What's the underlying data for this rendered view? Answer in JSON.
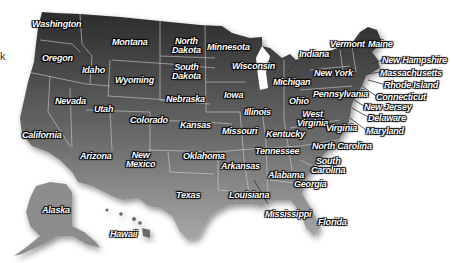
{
  "map": {
    "title": "United States map",
    "colors": {
      "top": "#2f2f2f",
      "bottom": "#9a9a9a",
      "border": "#d0d0d0",
      "label_text": "#ffffff",
      "label_outline": "#000000"
    },
    "edge_fragment": "k",
    "states": [
      {
        "name": "Washington",
        "x": 32,
        "y": 20
      },
      {
        "name": "Oregon",
        "x": 42,
        "y": 54
      },
      {
        "name": "Idaho",
        "x": 82,
        "y": 66
      },
      {
        "name": "Montana",
        "x": 112,
        "y": 38
      },
      {
        "name": "Wyoming",
        "x": 115,
        "y": 76
      },
      {
        "name": "North Dakota",
        "x": 172,
        "y": 37
      },
      {
        "name": "South Dakota",
        "x": 172,
        "y": 63
      },
      {
        "name": "Nebraska",
        "x": 166,
        "y": 95
      },
      {
        "name": "Minnesota",
        "x": 207,
        "y": 43
      },
      {
        "name": "Iowa",
        "x": 224,
        "y": 91
      },
      {
        "name": "Wisconsin",
        "x": 232,
        "y": 62
      },
      {
        "name": "Michigan",
        "x": 273,
        "y": 78
      },
      {
        "name": "Illinois",
        "x": 244,
        "y": 108
      },
      {
        "name": "Indiana",
        "x": 299,
        "y": 50
      },
      {
        "name": "Ohio",
        "x": 289,
        "y": 97
      },
      {
        "name": "Nevada",
        "x": 55,
        "y": 97
      },
      {
        "name": "Utah",
        "x": 94,
        "y": 105
      },
      {
        "name": "Colorado",
        "x": 130,
        "y": 116
      },
      {
        "name": "Kansas",
        "x": 180,
        "y": 121
      },
      {
        "name": "Missouri",
        "x": 222,
        "y": 127
      },
      {
        "name": "Kentucky",
        "x": 266,
        "y": 130
      },
      {
        "name": "West Virginia",
        "x": 297,
        "y": 110
      },
      {
        "name": "Virginia",
        "x": 326,
        "y": 124
      },
      {
        "name": "Maryland",
        "x": 366,
        "y": 127
      },
      {
        "name": "Delaware",
        "x": 368,
        "y": 114
      },
      {
        "name": "New Jersey",
        "x": 364,
        "y": 103
      },
      {
        "name": "Pennsylvania",
        "x": 313,
        "y": 90
      },
      {
        "name": "New York",
        "x": 314,
        "y": 69
      },
      {
        "name": "Vermont",
        "x": 330,
        "y": 40
      },
      {
        "name": "Maine",
        "x": 368,
        "y": 40
      },
      {
        "name": "New Hampshire",
        "x": 382,
        "y": 56
      },
      {
        "name": "Massachusetts",
        "x": 380,
        "y": 69
      },
      {
        "name": "Rhode Island",
        "x": 384,
        "y": 81
      },
      {
        "name": "Connecticut",
        "x": 376,
        "y": 93
      },
      {
        "name": "California",
        "x": 22,
        "y": 131
      },
      {
        "name": "Arizona",
        "x": 80,
        "y": 152
      },
      {
        "name": "New Mexico",
        "x": 126,
        "y": 151
      },
      {
        "name": "Oklahoma",
        "x": 183,
        "y": 152
      },
      {
        "name": "Tennessee",
        "x": 255,
        "y": 147
      },
      {
        "name": "North Carolina",
        "x": 312,
        "y": 142
      },
      {
        "name": "South Carolina",
        "x": 311,
        "y": 157
      },
      {
        "name": "Arkansas",
        "x": 221,
        "y": 162
      },
      {
        "name": "Alabama",
        "x": 268,
        "y": 171
      },
      {
        "name": "Georgia",
        "x": 294,
        "y": 180
      },
      {
        "name": "Texas",
        "x": 176,
        "y": 191
      },
      {
        "name": "Louisiana",
        "x": 229,
        "y": 191
      },
      {
        "name": "Mississippi",
        "x": 265,
        "y": 210
      },
      {
        "name": "Florida",
        "x": 318,
        "y": 218
      },
      {
        "name": "Alaska",
        "x": 42,
        "y": 206
      },
      {
        "name": "Hawaii",
        "x": 110,
        "y": 230
      }
    ]
  }
}
